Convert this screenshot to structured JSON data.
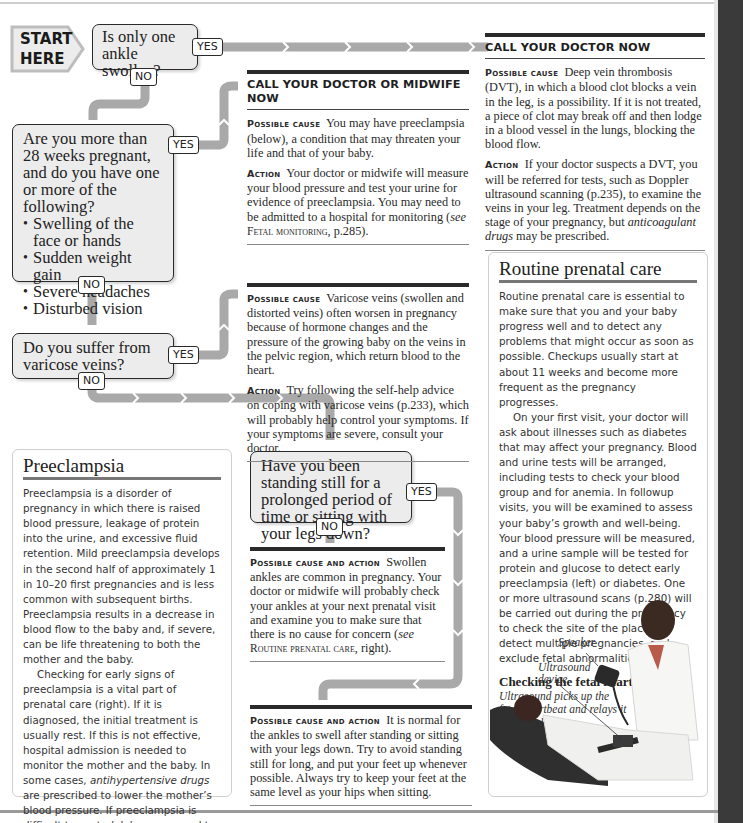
{
  "start": {
    "line1": "START",
    "line2": "HERE"
  },
  "flow": {
    "q1": "Is only one ankle swollen?",
    "q2_intro": "Are you more than 28 weeks pregnant, and do you have one or more of the following?",
    "q2_items": [
      "Swelling of the face or hands",
      "Sudden weight gain",
      "Severe headaches",
      "Disturbed vision"
    ],
    "q3": "Do you suffer from varicose veins?",
    "q4": "Have you been standing still for a prolonged period of time or sitting with your legs down?",
    "yes": "YES",
    "no": "NO"
  },
  "panels": {
    "dvt": {
      "header": "CALL YOUR DOCTOR NOW",
      "cause_label": "Possible cause",
      "cause_text": "Deep vein thrombosis (DVT), in which a blood clot blocks a vein in the leg, is a possibility. If it is not treated, a piece of clot may break off and then lodge in a blood vessel in the lungs, blocking the blood flow.",
      "action_label": "Action",
      "action_text_1": "If your doctor suspects a DVT, you will be referred for tests, such as Doppler ultrasound scanning (p.235), to examine the veins in your leg. Treatment depends on the stage of your pregnancy, but ",
      "action_em": "anticoagulant drugs",
      "action_text_2": " may be prescribed."
    },
    "preeclampsia_call": {
      "header": "CALL YOUR DOCTOR OR MIDWIFE NOW",
      "cause_label": "Possible cause",
      "cause_text": "You may have preeclampsia (below), a condition that may threaten your life and that of your baby.",
      "action_label": "Action",
      "action_text_1": "Your doctor or midwife will measure your blood pressure and test your urine for evidence of preeclampsia. You may need to be admitted to a hospital for monitoring (",
      "action_see": "see",
      "action_ref": "Fetal monitoring",
      "action_text_2": ", p.285)."
    },
    "varicose": {
      "cause_label": "Possible cause",
      "cause_text": "Varicose veins (swollen and distorted veins) often worsen in pregnancy because of hormone changes and the pressure of the growing baby on the veins in the pelvic region, which return blood to the heart.",
      "action_label": "Action",
      "action_text": "Try following the self-help advice on coping with varicose veins (p.233), which will probably help control your symptoms. If your symptoms are severe, consult your doctor."
    },
    "common": {
      "label": "Possible cause and action",
      "text_1": "Swollen ankles are common in pregnancy. Your doctor or midwife will probably check your ankles at your next prenatal visit and examine you to make sure that there is no cause for concern (",
      "see": "see",
      "ref": "Routine prenatal care",
      "text_2": ", right)."
    },
    "normal": {
      "label": "Possible cause and action",
      "text": "It is normal for the ankles to swell after standing or sitting with your legs down. Try to avoid standing still for long, and put your feet up whenever possible. Always try to keep your feet at the same level as your hips when sitting."
    }
  },
  "preeclampsia_box": {
    "title": "Preeclampsia",
    "p1": "Preeclampsia is a disorder of pregnancy in which there is raised blood pressure, leakage of protein into the urine, and excessive fluid retention. Mild preeclampsia develops in the second half of approximately 1 in 10–20 first pregnancies and is less common with subsequent births. Preeclampsia results in a decrease in blood flow to the baby and, if severe, can be life threatening to both the mother and the baby.",
    "p2_1": "Checking for early signs of preeclampsia is a vital part of prenatal care (right). If it is diagnosed, the initial treatment is usually rest. If this is not effective, hospital admission is needed to monitor the mother and the baby. In some cases, ",
    "p2_em": "antihypertensive drugs",
    "p2_2": " are prescribed to lower the mother’s blood pressure. If preeclampsia is difficult to control, labor may need to be induced early. Blood pressure usually returns to normal within a week of delivery."
  },
  "prenatal_box": {
    "title": "Routine prenatal care",
    "p1": "Routine prenatal care is essential to make sure that you and your baby progress well and to detect any problems that might occur as soon as possible. Checkups usually start at about 11 weeks and become more frequent as the pregnancy progresses.",
    "p2": "On your first visit, your doctor will ask about illnesses such as diabetes that may affect your pregnancy. Blood and urine tests will be arranged, including tests to check your blood group and for anemia. In followup visits, you will be examined to assess your baby’s growth and well-being. Your blood pressure will be measured, and a urine sample will be tested for protein and glucose to detect early preeclampsia (left) or diabetes. One or more ultrasound scans (p.280) will be carried out during the pregnancy to check the site of the placenta, detect multiple pregnancies, and exclude fetal abnormalities.",
    "caption_title": "Checking the fetal heart",
    "caption_text": "Ultrasound picks up the fetal heartbeat and relays it to a speaker.",
    "label_speaker": "Speaker",
    "label_device_1": "Ultrasound",
    "label_device_2": "device"
  },
  "colors": {
    "connector": "#a9a9a9",
    "box_fill": "#ececec",
    "border": "#2a2a2a"
  }
}
